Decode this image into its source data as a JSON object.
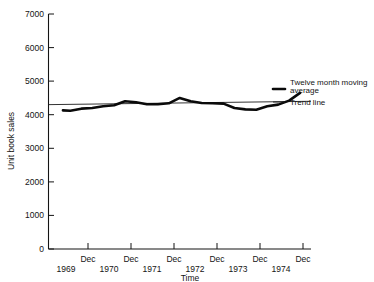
{
  "chart_data": {
    "type": "line",
    "title": "",
    "xlabel": "Time",
    "ylabel": "Unit book sales",
    "ylim": [
      0,
      7000
    ],
    "xlim": [
      1969.0,
      1975.0
    ],
    "grid": false,
    "legend_position": "right",
    "y_ticks": [
      0,
      1000,
      2000,
      3000,
      4000,
      5000,
      6000,
      7000
    ],
    "y_tick_labels": [
      "0",
      "1000",
      "2000",
      "3000",
      "4000",
      "5000",
      "6000",
      "7000"
    ],
    "x_tick_labels": [
      "Dec",
      "Dec",
      "Dec",
      "Dec",
      "Dec",
      "Dec"
    ],
    "x_year_labels": [
      "1969",
      "1970",
      "1971",
      "1972",
      "1973",
      "1974"
    ],
    "series": [
      {
        "name": "Twelve month moving average",
        "style": "thick-solid",
        "color": "#0a0a0a",
        "x": [
          1969.33,
          1969.5,
          1969.75,
          1970.0,
          1970.25,
          1970.5,
          1970.75,
          1971.0,
          1971.25,
          1971.5,
          1971.75,
          1972.0,
          1972.25,
          1972.5,
          1972.75,
          1973.0,
          1973.25,
          1973.5,
          1973.75,
          1974.0,
          1974.25,
          1974.5,
          1974.75
        ],
        "values": [
          4130,
          4120,
          4180,
          4200,
          4250,
          4280,
          4400,
          4370,
          4310,
          4310,
          4340,
          4500,
          4400,
          4350,
          4340,
          4330,
          4200,
          4160,
          4150,
          4250,
          4300,
          4420,
          4650
        ]
      },
      {
        "name": "Trend line",
        "style": "thin-solid",
        "color": "#1c1c1c",
        "x": [
          1969.0,
          1975.0
        ],
        "values": [
          4300,
          4400
        ]
      }
    ]
  },
  "legend": {
    "items": [
      {
        "label": "Twelve month moving average",
        "style": "thick-solid"
      },
      {
        "label": "Trend line",
        "style": "thin-solid"
      }
    ]
  },
  "axes": {
    "y_label": "Unit book sales",
    "x_label": "Time"
  }
}
